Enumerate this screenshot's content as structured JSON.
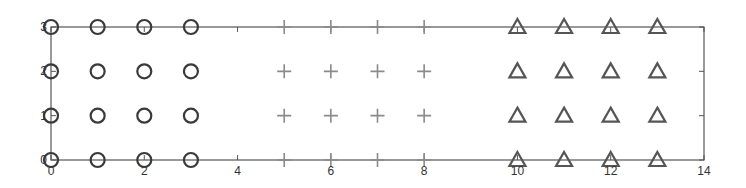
{
  "chart_data": {
    "type": "scatter",
    "title": "",
    "xlabel": "",
    "ylabel": "",
    "xlim": [
      0,
      14
    ],
    "ylim": [
      0,
      3
    ],
    "xticks": [
      0,
      2,
      4,
      6,
      8,
      10,
      12,
      14
    ],
    "yticks": [
      0,
      1,
      2,
      3
    ],
    "grid": false,
    "legend": null,
    "series": [
      {
        "name": "circles",
        "marker": "o",
        "color": "#3a3a3a",
        "x": [
          0,
          1,
          2,
          3,
          0,
          1,
          2,
          3,
          0,
          1,
          2,
          3,
          0,
          1,
          2,
          3
        ],
        "y": [
          0,
          0,
          0,
          0,
          1,
          1,
          1,
          1,
          2,
          2,
          2,
          2,
          3,
          3,
          3,
          3
        ]
      },
      {
        "name": "plus",
        "marker": "+",
        "color": "#8a8a8a",
        "x": [
          5,
          6,
          7,
          8,
          5,
          6,
          7,
          8,
          5,
          6,
          7,
          8,
          5,
          6,
          7,
          8
        ],
        "y": [
          0,
          0,
          0,
          0,
          1,
          1,
          1,
          1,
          2,
          2,
          2,
          2,
          3,
          3,
          3,
          3
        ]
      },
      {
        "name": "triangles",
        "marker": "^",
        "color": "#555555",
        "x": [
          10,
          11,
          12,
          13,
          10,
          11,
          12,
          13,
          10,
          11,
          12,
          13,
          10,
          11,
          12,
          13
        ],
        "y": [
          0,
          0,
          0,
          0,
          1,
          1,
          1,
          1,
          2,
          2,
          2,
          2,
          3,
          3,
          3,
          3
        ]
      }
    ]
  },
  "axis_color": "#555555"
}
